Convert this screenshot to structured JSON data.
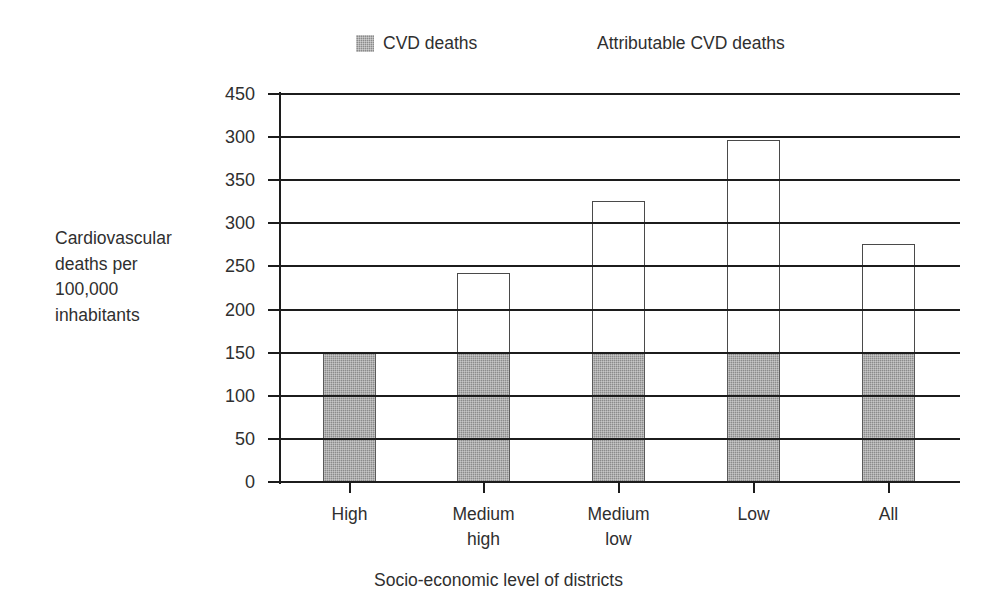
{
  "chart_data": {
    "type": "bar",
    "subtype": "stacked-vertical",
    "title": "",
    "xlabel": "Socio-economic level of districts",
    "ylabel": "Cardiovascular deaths per 100,000 inhabitants",
    "ylabel_lines": [
      "Cardiovascular",
      "deaths per",
      "100,000",
      "inhabitants"
    ],
    "categories": [
      "High",
      "Medium high",
      "Medium low",
      "Low",
      "All"
    ],
    "category_label_lines": [
      [
        "High"
      ],
      [
        "Medium",
        "high"
      ],
      [
        "Medium",
        "low"
      ],
      [
        "Low"
      ],
      [
        "All"
      ]
    ],
    "series": [
      {
        "name": "CVD deaths",
        "color": "#8b8b8b",
        "values": [
          150,
          150,
          150,
          150,
          150
        ]
      },
      {
        "name": "Attributable CVD deaths",
        "color": "#ffffff",
        "values": [
          0,
          92,
          176,
          247,
          126
        ]
      }
    ],
    "totals": [
      150,
      242,
      326,
      397,
      276
    ],
    "ytick_labels": [
      "450",
      "300",
      "350",
      "300",
      "250",
      "200",
      "150",
      "100",
      "50",
      "0"
    ],
    "ytick_positions": [
      450,
      400,
      350,
      300,
      250,
      200,
      150,
      100,
      50,
      0
    ],
    "ylim": [
      0,
      450
    ],
    "ytick_step": 50,
    "grid": true,
    "grid_orientation": "horizontal",
    "legend_position": "top"
  },
  "legend": {
    "entries": [
      {
        "label": "CVD deaths",
        "swatch": "gray-filled-square",
        "color": "#8b8b8b"
      },
      {
        "label": "Attributable CVD deaths",
        "swatch": "white-square",
        "color": "#ffffff"
      }
    ]
  },
  "axis": {
    "y_title_lines": [
      "Cardiovascular",
      "deaths per",
      "100,000",
      "inhabitants"
    ],
    "x_title": "Socio-economic level of districts"
  }
}
